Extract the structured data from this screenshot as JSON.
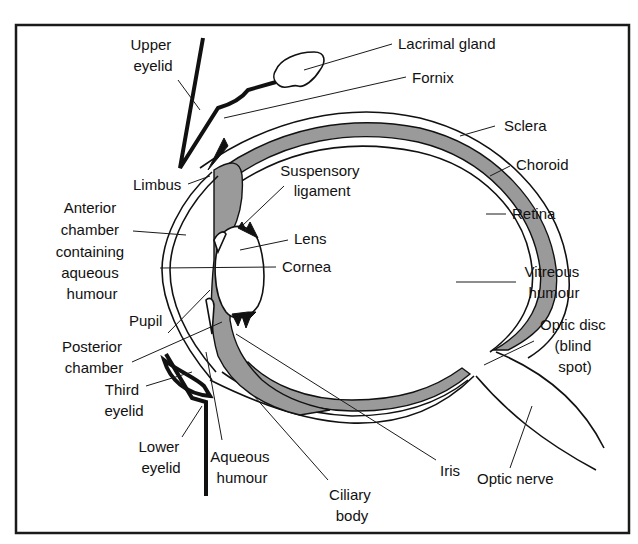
{
  "diagram": {
    "labels": {
      "upper_eyelid": [
        "Upper",
        "eyelid"
      ],
      "lacrimal_gland": [
        "Lacrimal gland"
      ],
      "fornix": [
        "Fornix"
      ],
      "sclera": [
        "Sclera"
      ],
      "choroid": [
        "Choroid"
      ],
      "retina": [
        "Retina"
      ],
      "limbus": [
        "Limbus"
      ],
      "suspensory_ligament": [
        "Suspensory",
        "ligament"
      ],
      "anterior_chamber": [
        "Anterior",
        "chamber",
        "containing",
        "aqueous",
        "humour"
      ],
      "lens": [
        "Lens"
      ],
      "cornea": [
        "Cornea"
      ],
      "vitreous_humour": [
        "Vitreous",
        "humour"
      ],
      "pupil": [
        "Pupil"
      ],
      "optic_disc": [
        "Optic disc",
        "(blind",
        "spot)"
      ],
      "posterior_chamber": [
        "Posterior",
        "chamber"
      ],
      "third_eyelid": [
        "Third",
        "eyelid"
      ],
      "lower_eyelid": [
        "Lower",
        "eyelid"
      ],
      "aqueous_humour": [
        "Aqueous",
        "humour"
      ],
      "iris": [
        "Iris"
      ],
      "optic_nerve": [
        "Optic nerve"
      ],
      "ciliary_body": [
        "Ciliary",
        "body"
      ]
    },
    "colors": {
      "line": "#111111",
      "pigment_layer": "#9a9a9a",
      "background": "#ffffff"
    }
  }
}
